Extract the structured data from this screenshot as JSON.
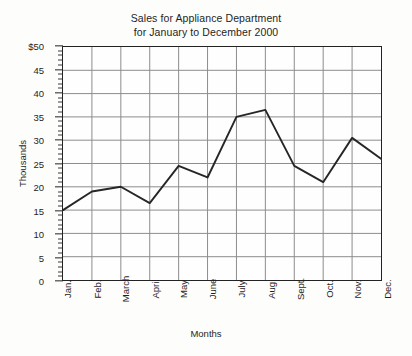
{
  "chart_data": {
    "type": "line",
    "title": "Sales for Appliance Department\nfor January to December 2000",
    "title_line1": "Sales for Appliance Department",
    "title_line2": "for January to December 2000",
    "xlabel": "Months",
    "ylabel": "Thousands",
    "categories": [
      "Jan.",
      "Feb.",
      "March",
      "April",
      "May",
      "June",
      "July",
      "Aug.",
      "Sept.",
      "Oct.",
      "Nov.",
      "Dec."
    ],
    "values": [
      15,
      19,
      20,
      16.5,
      24.5,
      22,
      35,
      36.5,
      24.5,
      21,
      30.5,
      26
    ],
    "series": [
      {
        "name": "Sales",
        "values": [
          15,
          19,
          20,
          16.5,
          24.5,
          22,
          35,
          36.5,
          24.5,
          21,
          30.5,
          26
        ]
      }
    ],
    "ylim": [
      0,
      50
    ],
    "ytick_step": 5,
    "yticks": [
      0,
      5,
      10,
      15,
      20,
      25,
      30,
      35,
      40,
      45,
      50
    ],
    "ytick_labels": [
      "0",
      "5",
      "10",
      "15",
      "20",
      "25",
      "30",
      "35",
      "40",
      "45",
      "$50"
    ],
    "y_minor_step": 1,
    "grid": true,
    "legend": "none",
    "line_color": "#262626",
    "grid_color": "#8c8c8c",
    "axis_color": "#232323",
    "background_color": "#fdfdfc"
  }
}
